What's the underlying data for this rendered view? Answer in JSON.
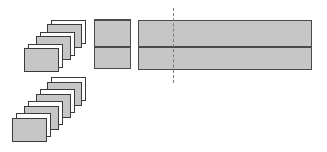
{
  "diagram": {
    "colors": {
      "fill": "#c6c6c6",
      "border": "#3a3a3a",
      "card_back": "#ffffff",
      "dash": "#7a7a7a"
    },
    "card_size": {
      "w": 35,
      "h": 24
    },
    "top_stack": [
      {
        "type": "white",
        "x": 51,
        "y": 20
      },
      {
        "type": "gray",
        "x": 47,
        "y": 24
      },
      {
        "type": "white",
        "x": 40,
        "y": 32
      },
      {
        "type": "gray",
        "x": 36,
        "y": 36
      },
      {
        "type": "white",
        "x": 28,
        "y": 44
      },
      {
        "type": "gray",
        "x": 24,
        "y": 48
      }
    ],
    "bottom_stack": [
      {
        "type": "white",
        "x": 51,
        "y": 77
      },
      {
        "type": "gray",
        "x": 47,
        "y": 82
      },
      {
        "type": "white",
        "x": 40,
        "y": 89
      },
      {
        "type": "gray",
        "x": 36,
        "y": 94
      },
      {
        "type": "white",
        "x": 28,
        "y": 101
      },
      {
        "type": "gray",
        "x": 24,
        "y": 106
      },
      {
        "type": "white",
        "x": 16,
        "y": 113
      },
      {
        "type": "gray",
        "x": 12,
        "y": 118
      }
    ],
    "middle_block": {
      "x": 94,
      "y": 19,
      "w": 37,
      "h": 50,
      "divider_y": 26
    },
    "wide_block": {
      "x": 138,
      "y": 20,
      "w": 174,
      "h": 50,
      "divider_y": 26
    },
    "dashed_line": {
      "x": 173,
      "y1": 8,
      "y2": 83
    }
  }
}
